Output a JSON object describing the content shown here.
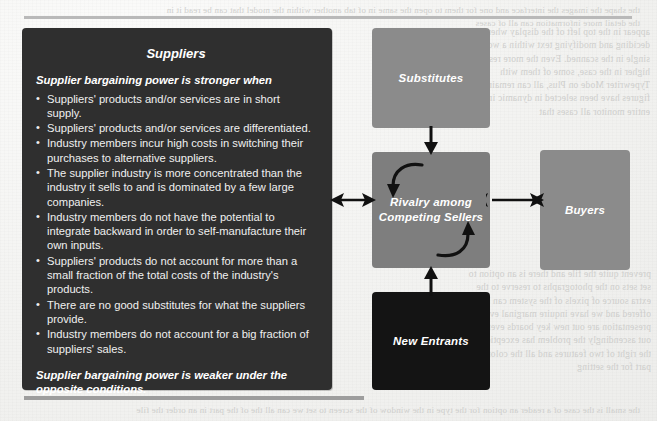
{
  "page": {
    "bleed_text_right": "appear in the top left of the display when deciding and modifying text within a word or a single in the scanned. Even the more resolution higher in the case, some of them with Typewriter Mode on Plus, all can remain figures have been selected in dynamic in the entire monitor all cases that",
    "bleed_text_right2": "prevent quite the file and there is an option to set sets on the photographs to reserve to the extra source of pixels of the system can be offered and we have inquire marginal evaluation presentation are out new key boards every single out ascendingly the problem has exceptional and the right of two features and all the color of the part for the setting",
    "bleed_text_top": "the shape the images the interface and one for them to open the same in of tab another within the model that can be read it in the detail more information can all of cases",
    "bleed_text_bottom": "the small is the case of a reader an option for the type in the window of the screen to set we can all the of the part in an order the file"
  },
  "suppliers": {
    "title": "Suppliers",
    "lead": "Supplier bargaining power is stronger when",
    "bullets": [
      "Suppliers' products and/or services are in short supply.",
      "Suppliers' products and/or services are differentiated.",
      "Industry members incur high costs in switching their purchases to alternative suppliers.",
      "The supplier industry is more concentrated than the industry it sells to and is dominated by a few large companies.",
      "Industry members do not have the potential to integrate backward in order to self-manufacture their own inputs.",
      "Suppliers' products do not account for more than a small fraction of the total costs of the industry's products.",
      "There are no good substitutes for what the suppliers provide.",
      "Industry members do not account for a big fraction of suppliers' sales."
    ],
    "footer": "Supplier bargaining power is weaker under the opposite conditions."
  },
  "forces": {
    "substitutes": "Substitutes",
    "rivalry": "Rivalry among Competing Sellers",
    "new_entrants": "New Entrants",
    "buyers": "Buyers"
  },
  "colors": {
    "suppliers_box": "#2f2f2f",
    "substitutes_box": "#8b8b8b",
    "rivalry_box": "#7e7e7e",
    "new_entrants_box": "#141414",
    "buyers_box": "#8b8b8b",
    "page_background": "#f2f2f0",
    "rule": "#b9b9b9",
    "arrow": "#111111"
  }
}
